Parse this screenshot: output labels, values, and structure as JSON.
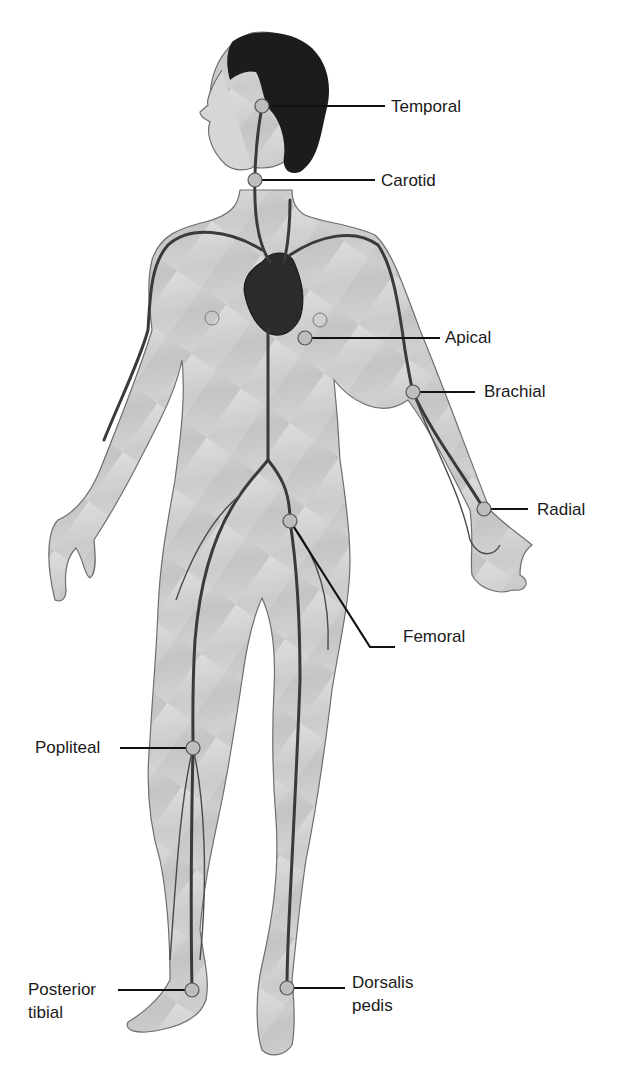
{
  "figure": {
    "colors": {
      "skin": "#cfcfcf",
      "skin_shade": "#b9b9b9",
      "outline": "#6e6e6e",
      "vessel": "#3a3a3a",
      "hair": "#1c1c1c",
      "heart": "#2b2b2b",
      "pulse_point_fill": "#bdbdbd",
      "pulse_point_stroke": "#555555",
      "leader": "#111111"
    }
  },
  "pulse_points": [
    {
      "id": "temporal",
      "label": "Temporal",
      "point": [
        262,
        106
      ],
      "label_pos": [
        391,
        97
      ]
    },
    {
      "id": "carotid",
      "label": "Carotid",
      "point": [
        255,
        180
      ],
      "label_pos": [
        381,
        172
      ]
    },
    {
      "id": "apical",
      "label": "Apical",
      "point": [
        305,
        338
      ],
      "label_pos": [
        445,
        327
      ]
    },
    {
      "id": "brachial",
      "label": "Brachial",
      "point": [
        413,
        392
      ],
      "label_pos": [
        485,
        381
      ]
    },
    {
      "id": "radial",
      "label": "Radial",
      "point": [
        484,
        509
      ],
      "label_pos": [
        537,
        500
      ]
    },
    {
      "id": "femoral",
      "label": "Femoral",
      "point": [
        290,
        521
      ],
      "label_pos": [
        403,
        627
      ]
    },
    {
      "id": "popliteal",
      "label": "Popliteal",
      "point": [
        193,
        748
      ],
      "label_pos": [
        35,
        738
      ]
    },
    {
      "id": "posterior_tibial",
      "label": "Posterior tibial",
      "label_line1": "Posterior",
      "label_line2": "tibial",
      "point": [
        192,
        990
      ],
      "label_pos": [
        28,
        980
      ]
    },
    {
      "id": "dorsalis_pedis",
      "label": "Dorsalis pedis",
      "label_line1": "Dorsalis",
      "label_line2": "pedis",
      "point": [
        287,
        988
      ],
      "label_pos": [
        352,
        972
      ]
    }
  ]
}
